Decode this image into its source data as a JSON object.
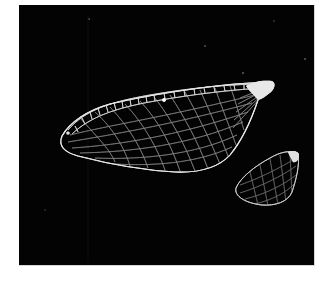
{
  "image": {
    "description": "Microscope photograph of two insect wings (forewing and hindwing) showing vein venation on black background",
    "background_color": "#030303",
    "border_color": "#ffffff",
    "vein_color": "#e8e8e8",
    "subjects": [
      {
        "name": "forewing",
        "label": ""
      },
      {
        "name": "hindwing",
        "label": ""
      }
    ]
  }
}
